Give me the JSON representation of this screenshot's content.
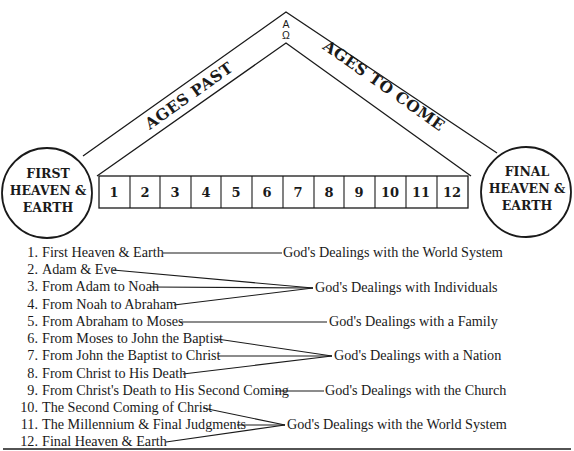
{
  "diagram": {
    "apex": {
      "top_symbol": "A",
      "bottom_symbol": "Ω"
    },
    "left_band_label": "AGES PAST",
    "right_band_label": "AGES TO COME",
    "left_circle": {
      "lines": [
        "FIRST",
        "HEAVEN &",
        "EARTH"
      ]
    },
    "right_circle": {
      "lines": [
        "FINAL",
        "HEAVEN &",
        "EARTH"
      ]
    },
    "boxes": [
      "1",
      "2",
      "3",
      "4",
      "5",
      "6",
      "7",
      "8",
      "9",
      "10",
      "11",
      "12"
    ]
  },
  "list": {
    "items": [
      {
        "num": "1.",
        "label": "First Heaven & Earth"
      },
      {
        "num": "2.",
        "label": "Adam & Eve"
      },
      {
        "num": "3.",
        "label": "From Adam to Noah"
      },
      {
        "num": "4.",
        "label": "From Noah to Abraham"
      },
      {
        "num": "5.",
        "label": "From Abraham to Moses"
      },
      {
        "num": "6.",
        "label": "From Moses to John the Baptist"
      },
      {
        "num": "7.",
        "label": "From John the Baptist to Christ"
      },
      {
        "num": "8.",
        "label": "From Christ to His Death"
      },
      {
        "num": "9.",
        "label": "From Christ's Death to His Second Coming"
      },
      {
        "num": "10.",
        "label": "The Second Coming of Christ"
      },
      {
        "num": "11.",
        "label": "The Millennium & Final Judgments"
      },
      {
        "num": "12.",
        "label": "Final Heaven & Earth"
      }
    ],
    "groups": [
      {
        "label": "God's Dealings with the World System",
        "items": [
          1
        ]
      },
      {
        "label": "God's Dealings with Individuals",
        "items": [
          2,
          3,
          4
        ]
      },
      {
        "label": "God's Dealings with a Family",
        "items": [
          5
        ]
      },
      {
        "label": "God's Dealings with a Nation",
        "items": [
          6,
          7,
          8
        ]
      },
      {
        "label": "God's Dealings with the Church",
        "items": [
          9
        ]
      },
      {
        "label": "God's Dealings with the World System",
        "items": [
          10,
          11,
          12
        ]
      }
    ]
  }
}
